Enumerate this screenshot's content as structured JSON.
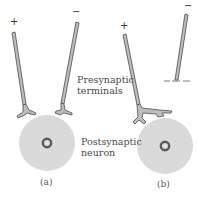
{
  "figure": {
    "labels": {
      "presynaptic_line1": "Presynaptic",
      "presynaptic_line2": "terminals",
      "postsynaptic_line1": "Postsynaptic",
      "postsynaptic_line2": "neuron"
    },
    "panels": [
      {
        "id": "a",
        "caption": "(a)",
        "electrodes": [
          {
            "sign": "+"
          },
          {
            "sign": "−"
          }
        ]
      },
      {
        "id": "b",
        "caption": "(b)",
        "electrodes": [
          {
            "sign": "+"
          },
          {
            "sign": "−"
          }
        ]
      }
    ],
    "colors": {
      "neuron_fill": "#d9d9d9",
      "electrode_fill": "#b8b8b8",
      "outline": "#4a4a4a",
      "nucleus": "#555555"
    }
  }
}
